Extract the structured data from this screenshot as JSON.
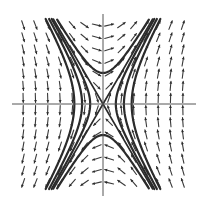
{
  "chart_data": {
    "type": "slope_field",
    "title": "",
    "xlabel": "",
    "ylabel": "",
    "xlim": [
      -3,
      3
    ],
    "ylim": [
      -3,
      3
    ],
    "grid": false,
    "legend": null,
    "system": {
      "dx_dt": "y",
      "dy_dt": "3x"
    },
    "equilibrium": {
      "x": 0,
      "y": 0,
      "type": "saddle"
    },
    "separatrices": [
      {
        "slope": 1.732,
        "label": "unstable direction"
      },
      {
        "slope": -1.732,
        "label": "stable direction"
      }
    ],
    "field_grid": {
      "nx": 14,
      "ny": 14
    },
    "solution_curves": [
      {
        "family": "right",
        "c": 0.6
      },
      {
        "family": "right",
        "c": 1.6
      },
      {
        "family": "right",
        "c": 3.0
      },
      {
        "family": "left",
        "c": 0.6
      },
      {
        "family": "left",
        "c": 1.6
      },
      {
        "family": "left",
        "c": 3.0
      },
      {
        "family": "top",
        "c": 1.2
      },
      {
        "family": "bottom",
        "c": 1.2
      }
    ]
  },
  "layout": {
    "width": 202,
    "height": 207,
    "plot_left": 18,
    "plot_right": 190,
    "plot_top": 20,
    "plot_bottom": 190,
    "origin_x": 103,
    "origin_y": 104
  },
  "colors": {
    "background": "#ffffff",
    "axis": "#555555",
    "arrow": "#3a3a3a",
    "curve": "#2b2b2b"
  }
}
